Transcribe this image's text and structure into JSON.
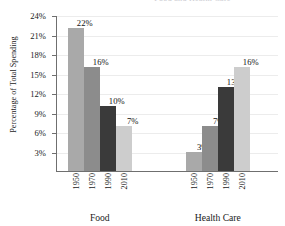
{
  "chart_data": {
    "type": "bar",
    "title": "Food and Health Care",
    "xlabel": "",
    "ylabel": "Percentage of Total Spending",
    "ylim": [
      0,
      24
    ],
    "ytick_labels": [
      "3%",
      "6%",
      "9%",
      "12%",
      "15%",
      "18%",
      "21%",
      "24%"
    ],
    "ytick_values": [
      3,
      6,
      9,
      12,
      15,
      18,
      21,
      24
    ],
    "grid": true,
    "legend": "none",
    "categories": [
      "1950",
      "1970",
      "1990",
      "2010"
    ],
    "groups": [
      {
        "name": "Food",
        "values": [
          22,
          16,
          10,
          7
        ],
        "value_labels": [
          "22%",
          "16%",
          "10%",
          "7%"
        ]
      },
      {
        "name": "Health Care",
        "values": [
          3,
          7,
          13,
          16
        ],
        "value_labels": [
          "3%",
          "7%",
          "13%",
          "16%"
        ]
      }
    ],
    "series_colors": [
      "#a9a9a9",
      "#8c8c8c",
      "#3a3a3a",
      "#cdcdcd"
    ],
    "axis_color": "#6f6f6f",
    "gridline_color": "#ececec"
  }
}
